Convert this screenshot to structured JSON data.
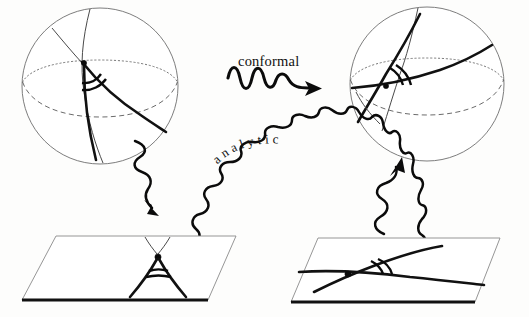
{
  "figure": {
    "background_color": "#fdfdfc",
    "ink_color": "#111111",
    "labels": {
      "conformal": "conformal",
      "analytic": "analytic"
    },
    "panels": {
      "top_left": {
        "name": "sphere-left",
        "shape": "sphere",
        "features": [
          "outline-circle",
          "dashed-equator",
          "dotted-equator-arc",
          "meridian-curve",
          "bold-geodesic-curve",
          "intersection-point",
          "double-angle-arc"
        ]
      },
      "top_right": {
        "name": "sphere-right",
        "shape": "sphere",
        "features": [
          "outline-circle",
          "dashed-equator",
          "dotted-equator-arc",
          "meridian-curve",
          "bold-geodesic-curve",
          "intersection-point",
          "double-angle-arc"
        ]
      },
      "bottom_left": {
        "name": "plane-left",
        "shape": "parallelogram",
        "features": [
          "cusp-point",
          "two-curves-tangent",
          "double-angle-arc",
          "thick-front-edge"
        ]
      },
      "bottom_right": {
        "name": "plane-right",
        "shape": "parallelogram",
        "features": [
          "crossing-point",
          "two-curves-transverse",
          "double-angle-arc",
          "thick-front-edge"
        ]
      }
    },
    "arrows": {
      "conformal_arrow": {
        "name": "conformal-wavy-arrow",
        "from": "sphere-left",
        "to": "sphere-right",
        "direction": "right",
        "style": "wavy"
      },
      "analytic_arrow": {
        "name": "analytic-wavy-arc-arrow",
        "from": "plane-left",
        "to": "plane-right",
        "direction": "right-over-arc",
        "style": "wavy"
      },
      "project_left": {
        "name": "projection-arrow-down-left",
        "from": "sphere-left",
        "to": "plane-left",
        "direction": "down",
        "style": "wavy"
      },
      "project_right": {
        "name": "projection-arrow-up-right",
        "from": "plane-right",
        "to": "sphere-right",
        "direction": "up",
        "style": "wavy"
      }
    }
  }
}
